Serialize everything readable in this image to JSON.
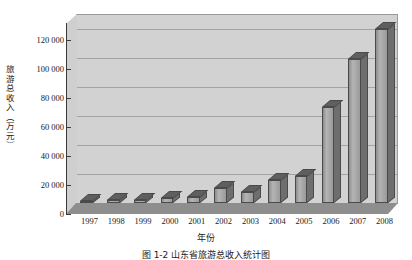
{
  "figure": {
    "caption": "图 1-2  山东省旅游总收入统计图"
  },
  "chart_data": {
    "type": "bar",
    "title": "",
    "xlabel": "年份",
    "ylabel": "旅游总收入（万元）",
    "categories": [
      "1997",
      "1998",
      "1999",
      "2000",
      "2001",
      "2002",
      "2003",
      "2004",
      "2005",
      "2006",
      "2007",
      "2008"
    ],
    "values": [
      1500,
      1800,
      2200,
      3500,
      4000,
      10500,
      7500,
      15500,
      18500,
      66000,
      99000,
      120000
    ],
    "ylim": [
      0,
      130000
    ],
    "ytick_values": [
      0,
      20000,
      40000,
      60000,
      80000,
      100000,
      120000
    ],
    "ytick_labels": [
      "0",
      "20 000",
      "40 000",
      "60 000",
      "80 000",
      "100 000",
      "120 000"
    ],
    "grid": true,
    "legend": "none",
    "style": "3d-column",
    "colors": {
      "bar_face": "#9a9a9a",
      "bar_side": "#6e6e6e",
      "bar_top": "#5f5f5f",
      "plot_background": "#d2d2d2",
      "floor": "#8e8e8e",
      "gridline": "#a3a3a3",
      "axis": "#3a3a3a",
      "text": "#1a1a1a"
    }
  }
}
